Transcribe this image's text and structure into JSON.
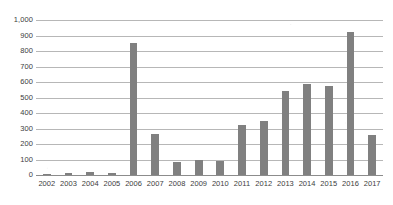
{
  "chart_data": {
    "type": "bar",
    "title": "",
    "subtitle": "",
    "xlabel": "",
    "ylabel": "",
    "categories": [
      "2002",
      "2003",
      "2004",
      "2005",
      "2006",
      "2007",
      "2008",
      "2009",
      "2010",
      "2011",
      "2012",
      "2013",
      "2014",
      "2015",
      "2016",
      "2017"
    ],
    "values": [
      2,
      12,
      18,
      14,
      850,
      265,
      85,
      100,
      88,
      322,
      348,
      545,
      590,
      572,
      925,
      255
    ],
    "series": [
      {
        "name": "",
        "values": [
          2,
          12,
          18,
          14,
          850,
          265,
          85,
          100,
          88,
          322,
          348,
          545,
          590,
          572,
          925,
          255
        ]
      }
    ],
    "ylim": [
      0,
      1000
    ],
    "ytick_values": [
      0,
      100,
      200,
      300,
      400,
      500,
      600,
      700,
      800,
      900,
      1000
    ],
    "ytick_labels": [
      "0",
      "100",
      "200",
      "300",
      "400",
      "500",
      "600",
      "700",
      "800",
      "900",
      "1,000"
    ],
    "grid": true,
    "grid_axis": "y",
    "legend": false,
    "legend_position": "none",
    "bar_color": "#808080",
    "gridline_color": "#b7b7b7",
    "axis_color": "#8c8c8c",
    "background_color": "#ffffff",
    "text_color": "#3d3d3d",
    "annotations": []
  }
}
